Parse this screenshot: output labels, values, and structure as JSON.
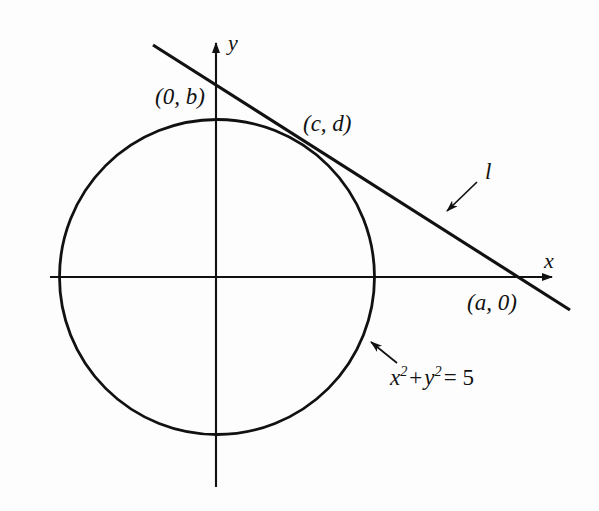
{
  "figure": {
    "type": "geometry-diagram",
    "background_color": "#fdfdfd",
    "stroke_color": "#111111"
  },
  "axes": {
    "x_label": "x",
    "y_label": "y",
    "origin": {
      "x": 216,
      "y": 277
    },
    "x_axis": {
      "from_x": 50,
      "to_x": 562,
      "y": 277,
      "arrow": "right"
    },
    "y_axis": {
      "x": 216,
      "from_y": 487,
      "to_y": 33,
      "arrow": "up"
    }
  },
  "circle": {
    "equation": {
      "var_x": "x",
      "sup_x": "2",
      "plus": "+",
      "var_y": "y",
      "sup_y": "2",
      "equals": "= 5"
    },
    "equation_plain": "x2 + y2 = 5",
    "center": {
      "x": 217,
      "y": 277
    },
    "radius": 158
  },
  "line": {
    "name": "l",
    "from": {
      "x": 153,
      "y": 45
    },
    "to": {
      "x": 570,
      "y": 310
    }
  },
  "points": [
    {
      "label": "(0, b)",
      "name": "y-intercept",
      "x": 155,
      "y": 85
    },
    {
      "label": "(c, d)",
      "name": "tangent-point",
      "x": 303,
      "y": 112
    },
    {
      "label": "(a, 0)",
      "name": "x-intercept",
      "x": 467,
      "y": 291
    }
  ],
  "annotations": [
    {
      "name": "line-label-callout",
      "text": "l",
      "arrow_from": {
        "x": 477,
        "y": 182
      },
      "arrow_to": {
        "x": 443,
        "y": 214
      }
    },
    {
      "name": "circle-equation-callout",
      "arrow_from": {
        "x": 397,
        "y": 363
      },
      "arrow_to": {
        "x": 367,
        "y": 339
      }
    }
  ]
}
